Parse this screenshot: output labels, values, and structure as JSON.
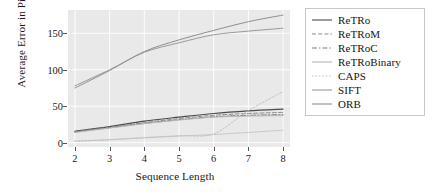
{
  "chart_data": {
    "type": "line",
    "title": "",
    "xlabel": "Sequence Length",
    "ylabel": "Average Error in Pixels",
    "x": [
      2,
      3,
      4,
      5,
      6,
      7,
      8
    ],
    "xlim": [
      1.8,
      8.2
    ],
    "ylim": [
      -6,
      182
    ],
    "xticks": [
      "2",
      "3",
      "4",
      "5",
      "6",
      "7",
      "8"
    ],
    "yticks": [
      "0",
      "50",
      "100",
      "150"
    ],
    "ytickvalues": [
      0,
      50,
      100,
      150
    ],
    "grid": true,
    "grid_color": "#ffffff",
    "panel_color": "#e9e9e9",
    "legend_position": "right",
    "series": [
      {
        "name": "ReTRo",
        "color": "#4a4a4a",
        "dash": "solid",
        "values": [
          15.5,
          22.0,
          29.5,
          35.0,
          40.0,
          43.5,
          46.0
        ]
      },
      {
        "name": "ReTRoM",
        "color": "#8c8c8c",
        "dash": "dashed",
        "values": [
          15.0,
          21.0,
          27.5,
          33.0,
          37.5,
          40.0,
          41.5
        ]
      },
      {
        "name": "ReTRoC",
        "color": "#7a7a7a",
        "dash": "dashdot",
        "values": [
          14.5,
          20.5,
          26.5,
          31.5,
          35.5,
          37.5,
          38.5
        ]
      },
      {
        "name": "ReTRoBinary",
        "color": "#b4b4b4",
        "dash": "solid",
        "values": [
          14.0,
          20.0,
          26.0,
          31.0,
          35.0,
          36.5,
          37.0
        ]
      },
      {
        "name": "CAPS",
        "color": "#c0c0c0",
        "dash": "dotted",
        "values": [
          2.0,
          4.0,
          7.0,
          9.5,
          12.0,
          44.0,
          70.0
        ]
      },
      {
        "name": "SIFT",
        "color": "#9a9a9a",
        "dash": "solid",
        "values": [
          78.0,
          100.0,
          124.0,
          137.0,
          148.0,
          153.0,
          157.0
        ]
      },
      {
        "name": "ORB",
        "color": "#8f8f8f",
        "dash": "solid",
        "values": [
          75.0,
          99.0,
          125.0,
          141.0,
          154.0,
          166.0,
          175.0
        ]
      }
    ],
    "baseline_series": {
      "name": "ORB-low",
      "color": "#c9c9c9",
      "dash": "solid",
      "values": [
        2.0,
        4.0,
        6.5,
        9.0,
        11.0,
        14.0,
        17.0
      ]
    }
  }
}
